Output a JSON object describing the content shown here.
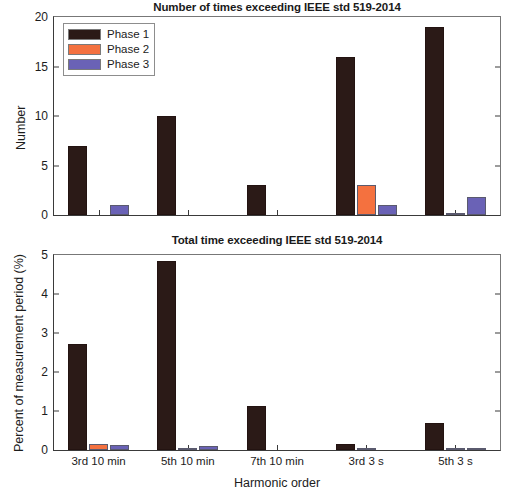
{
  "figure": {
    "xlabel": "Harmonic order"
  },
  "colors": {
    "phase1": "#2b1a17",
    "phase2": "#f4713f",
    "phase3": "#6a62b6",
    "axis": "#3a3a3a",
    "text": "#1c1c1c"
  },
  "legend": {
    "position": "top-left",
    "entries": [
      {
        "label": "Phase 1",
        "color": "#2b1a17"
      },
      {
        "label": "Phase 2",
        "color": "#f4713f"
      },
      {
        "label": "Phase 3",
        "color": "#6a62b6"
      }
    ]
  },
  "chart_data": [
    {
      "type": "bar",
      "title": "Number of times exceeding IEEE std 519-2014",
      "xlabel": "",
      "ylabel": "Number",
      "categories": [
        "3rd 10 min",
        "5th 10 min",
        "7th 10 min",
        "3rd 3 s",
        "5th 3 s"
      ],
      "series": [
        {
          "name": "Phase 1",
          "color": "#2b1a17",
          "values": [
            7,
            10,
            3,
            16,
            19
          ]
        },
        {
          "name": "Phase 2",
          "color": "#f4713f",
          "values": [
            0,
            0,
            0,
            3,
            0.08
          ]
        },
        {
          "name": "Phase 3",
          "color": "#6a62b6",
          "values": [
            1,
            0,
            0,
            1,
            1.8
          ]
        }
      ],
      "ylim": [
        0,
        20
      ],
      "yticks": [
        0,
        5,
        10,
        15,
        20
      ],
      "grid": false,
      "legend_position": "upper left"
    },
    {
      "type": "bar",
      "title": "Total time exceeding IEEE std 519-2014",
      "xlabel": "Harmonic order",
      "ylabel": "Percent of measurement period (%)",
      "categories": [
        "3rd 10 min",
        "5th 10 min",
        "7th 10 min",
        "3rd 3 s",
        "5th 3 s"
      ],
      "series": [
        {
          "name": "Phase 1",
          "color": "#2b1a17",
          "values": [
            2.72,
            4.84,
            1.12,
            0.15,
            0.7
          ]
        },
        {
          "name": "Phase 2",
          "color": "#f4713f",
          "values": [
            0.15,
            0.05,
            0,
            0.03,
            0.02
          ]
        },
        {
          "name": "Phase 3",
          "color": "#6a62b6",
          "values": [
            0.12,
            0.1,
            0,
            0,
            0.02
          ]
        }
      ],
      "ylim": [
        0,
        5
      ],
      "yticks": [
        0,
        1,
        2,
        3,
        4,
        5
      ],
      "grid": false,
      "legend_position": "none"
    }
  ]
}
